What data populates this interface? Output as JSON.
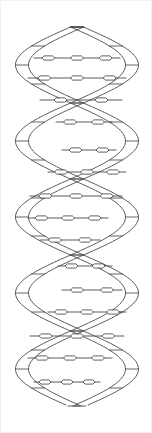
{
  "figure": {
    "style": "black-and-white line art",
    "background_color": "#ffffff",
    "stroke_color": "#4a4a4a",
    "rung_color": "#3d3d3d",
    "basepair_fill": "#ffffff",
    "basepair_stroke": "#3a3a3a",
    "frame_color": "#f2f2f2",
    "canvas": {
      "width": 152,
      "height": 433
    },
    "drawing_bounds": {
      "x_min": 22,
      "x_max": 132,
      "y_min": 27,
      "y_max": 406
    }
  },
  "chart_data": {
    "type": "line",
    "xlabel": "",
    "ylabel": "",
    "axis_center_x": 77,
    "amplitude": 55,
    "period": 152,
    "y_start": 27,
    "y_end": 406,
    "ribbon_thickness": 13,
    "phase_offset_deg": 180,
    "series": [
      {
        "name": "strand-a",
        "phase_deg": 0,
        "direction": "front-to-back"
      },
      {
        "name": "strand-b",
        "phase_deg": 180,
        "direction": "back-to-front"
      }
    ],
    "rungs": [
      {
        "index": 1,
        "y": 58,
        "x_left": 34,
        "x_right": 120,
        "basepairs": 3
      },
      {
        "index": 2,
        "y": 78,
        "x_left": 28,
        "x_right": 126,
        "basepairs": 3
      },
      {
        "index": 3,
        "y": 100,
        "x_left": 40,
        "x_right": 122,
        "basepairs": 2
      },
      {
        "index": 4,
        "y": 122,
        "x_left": 56,
        "x_right": 112,
        "basepairs": 2
      },
      {
        "index": 5,
        "y": 150,
        "x_left": 62,
        "x_right": 116,
        "basepairs": 2
      },
      {
        "index": 6,
        "y": 172,
        "x_left": 48,
        "x_right": 126,
        "basepairs": 3
      },
      {
        "index": 7,
        "y": 196,
        "x_left": 30,
        "x_right": 122,
        "basepairs": 3
      },
      {
        "index": 8,
        "y": 218,
        "x_left": 28,
        "x_right": 108,
        "basepairs": 3
      },
      {
        "index": 9,
        "y": 240,
        "x_left": 40,
        "x_right": 100,
        "basepairs": 2
      },
      {
        "index": 10,
        "y": 266,
        "x_left": 58,
        "x_right": 112,
        "basepairs": 2
      },
      {
        "index": 11,
        "y": 290,
        "x_left": 62,
        "x_right": 122,
        "basepairs": 2
      },
      {
        "index": 12,
        "y": 312,
        "x_left": 48,
        "x_right": 126,
        "basepairs": 3
      },
      {
        "index": 13,
        "y": 336,
        "x_left": 30,
        "x_right": 124,
        "basepairs": 3
      },
      {
        "index": 14,
        "y": 358,
        "x_left": 28,
        "x_right": 112,
        "basepairs": 3
      },
      {
        "index": 15,
        "y": 382,
        "x_left": 34,
        "x_right": 100,
        "basepairs": 3
      }
    ]
  }
}
